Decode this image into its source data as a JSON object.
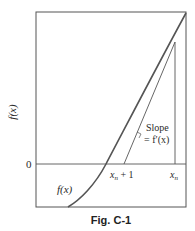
{
  "figure": {
    "caption": "Fig. C-1",
    "y_axis_label": "f(x)",
    "zero_label": "0",
    "curve_label": "f(x)",
    "slope_label_line1": "Slope",
    "slope_label_line2": "= f′(x)",
    "x_next_label_main": "x",
    "x_next_label_sub": "n",
    "x_next_label_suffix": " + 1",
    "x_n_label_main": "x",
    "x_n_label_sub": "n",
    "colors": {
      "curve": "#555555",
      "frame": "#555555",
      "text": "#2a2a2a"
    }
  }
}
